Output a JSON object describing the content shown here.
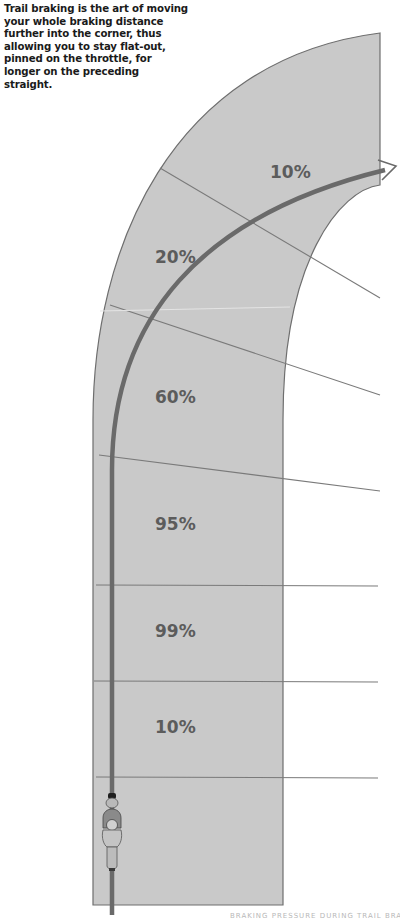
{
  "intro_text": "Trail braking is the art of moving your whole braking distance further into the corner, thus allowing you to stay flat-out, pinned on the throttle, for longer on the preceding straight.",
  "zones": [
    {
      "label": "10%",
      "x": 270,
      "y": 178
    },
    {
      "label": "20%",
      "x": 155,
      "y": 263
    },
    {
      "label": "60%",
      "x": 155,
      "y": 403
    },
    {
      "label": "95%",
      "x": 155,
      "y": 530
    },
    {
      "label": "99%",
      "x": 155,
      "y": 637
    },
    {
      "label": "10%",
      "x": 155,
      "y": 733
    }
  ],
  "footer_text": "BRAKING PRESSURE DURING TRAIL BRAKING",
  "colors": {
    "road_fill": "#c9c9c9",
    "road_edge": "#6e6e6e",
    "racing_line": "#6a6a6a",
    "divider": "#7a7a7a",
    "label": "#5c5c5c"
  }
}
